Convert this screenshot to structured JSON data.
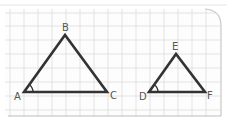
{
  "diagram": {
    "type": "similar-triangles",
    "colors": {
      "background": "#ffffff",
      "paper": "#fdfdfd",
      "grid": "#dcdcdc",
      "paper_edge": "#c8c8c8",
      "stroke": "#333333",
      "label": "#555555"
    },
    "triangles": [
      {
        "name": "ABC",
        "vertices": {
          "A": {
            "label": "A",
            "x": 24,
            "y": 92
          },
          "B": {
            "label": "B",
            "x": 65,
            "y": 35
          },
          "C": {
            "label": "C",
            "x": 107,
            "y": 92
          }
        },
        "marked_angle": "A"
      },
      {
        "name": "DEF",
        "vertices": {
          "D": {
            "label": "D",
            "x": 149,
            "y": 92
          },
          "E": {
            "label": "E",
            "x": 176,
            "y": 54
          },
          "F": {
            "label": "F",
            "x": 205,
            "y": 92
          }
        },
        "marked_angle": "D"
      }
    ],
    "labels": {
      "A": "A",
      "B": "B",
      "C": "C",
      "D": "D",
      "E": "E",
      "F": "F"
    }
  }
}
